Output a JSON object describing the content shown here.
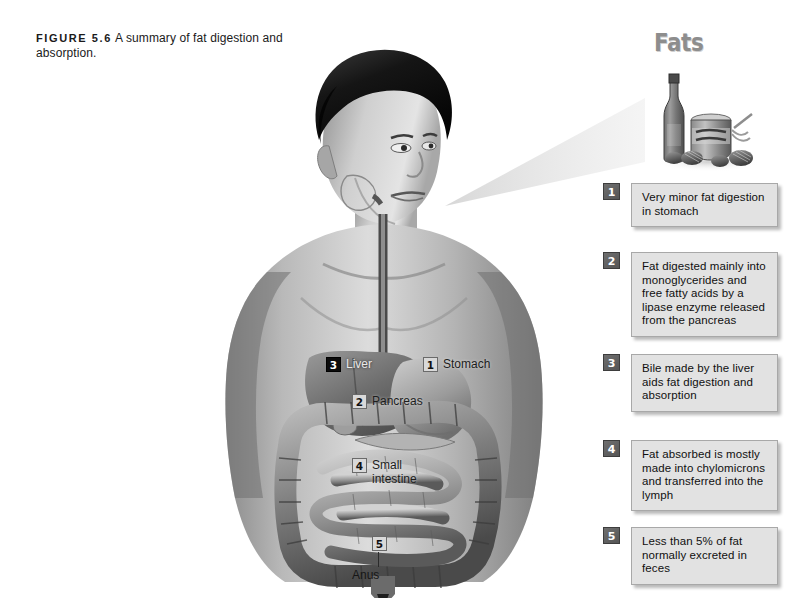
{
  "figure": {
    "label": "FIGURE 5.6",
    "caption": "A summary of fat digestion and absorption."
  },
  "fats_panel": {
    "title": "Fats",
    "image_alt": "fats-still-life"
  },
  "steps": [
    {
      "number": "1",
      "text": "Very minor fat digestion in stomach"
    },
    {
      "number": "2",
      "text": "Fat digested mainly into monoglycerides and free fatty acids by a lipase enzyme released from the pancreas"
    },
    {
      "number": "3",
      "text": "Bile made by the liver aids fat digestion and absorption"
    },
    {
      "number": "4",
      "text": "Fat absorbed is mostly made into chylomicrons and transferred into the lymph"
    },
    {
      "number": "5",
      "text": "Less than 5% of fat normally excreted in feces"
    }
  ],
  "organ_labels": [
    {
      "number": "3",
      "name": "Liver"
    },
    {
      "number": "1",
      "name": "Stomach"
    },
    {
      "number": "2",
      "name": "Pancreas"
    },
    {
      "number": "4",
      "name": "Small intestine"
    },
    {
      "number": "5",
      "name": "Anus"
    }
  ],
  "colors": {
    "page_background": "#ffffff",
    "callout_box": "#e2e2e2",
    "callout_border": "#a8a8a8",
    "callout_number": "#555555",
    "fats_title": "#8d8d8d",
    "text": "#101010"
  }
}
